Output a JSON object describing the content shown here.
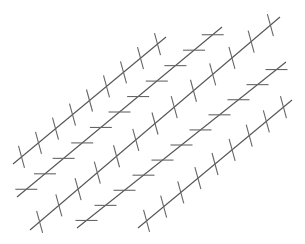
{
  "colors": {
    "background": "#ffffff",
    "line": "#555555",
    "tick": "#666666"
  },
  "tick_half_length": 7,
  "lines": [
    {
      "id": 1,
      "x1": 13,
      "y1": 164,
      "x2": 166,
      "y2": 37,
      "tick_orientation": "vertical",
      "tick_count": 9
    },
    {
      "id": 2,
      "x1": 17,
      "y1": 197,
      "x2": 222,
      "y2": 27,
      "tick_orientation": "horizontal",
      "tick_count": 11
    },
    {
      "id": 3,
      "x1": 30,
      "y1": 230,
      "x2": 280,
      "y2": 17,
      "tick_orientation": "vertical",
      "tick_count": 13
    },
    {
      "id": 4,
      "x1": 77,
      "y1": 228,
      "x2": 286,
      "y2": 62,
      "tick_orientation": "horizontal",
      "tick_count": 11
    },
    {
      "id": 5,
      "x1": 138,
      "y1": 228,
      "x2": 292,
      "y2": 100,
      "tick_orientation": "vertical",
      "tick_count": 9
    }
  ]
}
